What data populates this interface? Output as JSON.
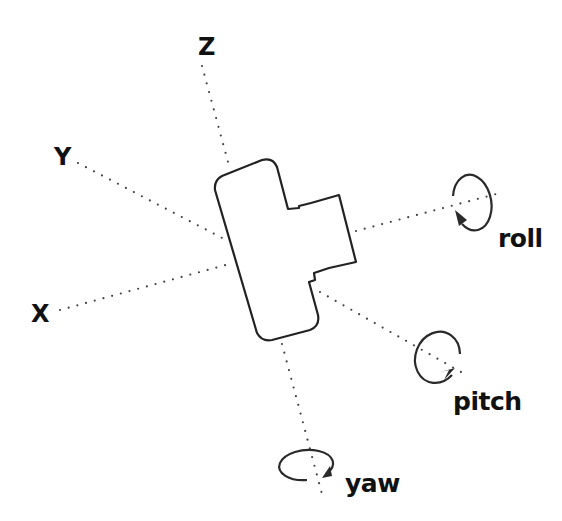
{
  "diagram": {
    "axes": [
      {
        "name": "X",
        "label": "X"
      },
      {
        "name": "Y",
        "label": "Y"
      },
      {
        "name": "Z",
        "label": "Z"
      }
    ],
    "rotations": [
      {
        "name": "roll",
        "label": "roll"
      },
      {
        "name": "pitch",
        "label": "pitch"
      },
      {
        "name": "yaw",
        "label": "yaw"
      }
    ],
    "colors": {
      "line": "#222222",
      "dots": "#444444",
      "background": "#ffffff"
    }
  }
}
